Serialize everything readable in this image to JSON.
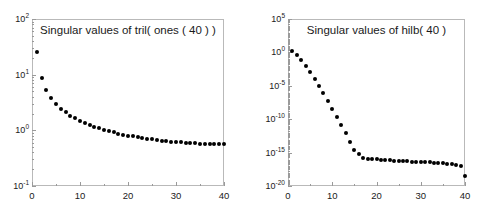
{
  "figure": {
    "background_color": "#ffffff",
    "axis_color": "#b9b9b9",
    "marker_color": "#000000",
    "panels": [
      {
        "id": "tril-ones-40",
        "title": "Singular values of tril( ones ( 40 ) )",
        "x_ticks": [
          "0",
          "10",
          "20",
          "30",
          "40"
        ],
        "y_ticks": [
          "10",
          "10",
          "10",
          "10"
        ],
        "y_tick_exponents": [
          "2",
          "1",
          "0",
          "-1"
        ]
      },
      {
        "id": "hilb-40",
        "title": "Singular values of hilb( 40 )",
        "x_ticks": [
          "0",
          "10",
          "20",
          "30",
          "40"
        ],
        "y_ticks": [
          "10",
          "10",
          "10",
          "10",
          "10",
          "10"
        ],
        "y_tick_exponents": [
          "5",
          "0",
          "-5",
          "-10",
          "-15",
          "-20"
        ]
      }
    ]
  },
  "chart_data": [
    {
      "type": "scatter",
      "id": "tril-ones-40",
      "title": "Singular values of tril( ones ( 40 ) )",
      "xlabel": "",
      "ylabel": "",
      "xlim": [
        0,
        40
      ],
      "ylim": [
        0.1,
        100
      ],
      "yscale": "log",
      "xscale": "linear",
      "grid": false,
      "legend": null,
      "marker": "filled-circle",
      "x": [
        1,
        2,
        3,
        4,
        5,
        6,
        7,
        8,
        9,
        10,
        11,
        12,
        13,
        14,
        15,
        16,
        17,
        18,
        19,
        20,
        21,
        22,
        23,
        24,
        25,
        26,
        27,
        28,
        29,
        30,
        31,
        32,
        33,
        34,
        35,
        36,
        37,
        38,
        39,
        40
      ],
      "y": [
        25.4,
        8.6,
        5.2,
        3.75,
        2.95,
        2.45,
        2.1,
        1.84,
        1.64,
        1.48,
        1.35,
        1.25,
        1.16,
        1.08,
        1.02,
        0.965,
        0.917,
        0.875,
        0.838,
        0.805,
        0.776,
        0.75,
        0.727,
        0.706,
        0.687,
        0.67,
        0.655,
        0.641,
        0.629,
        0.618,
        0.608,
        0.599,
        0.591,
        0.584,
        0.578,
        0.572,
        0.567,
        0.563,
        0.56,
        0.557
      ]
    },
    {
      "type": "scatter",
      "id": "hilb-40",
      "title": "Singular values of hilb( 40 )",
      "xlabel": "",
      "ylabel": "",
      "xlim": [
        0,
        40
      ],
      "ylim": [
        1e-20,
        100000.0
      ],
      "yscale": "log",
      "xscale": "linear",
      "grid": false,
      "legend": null,
      "marker": "filled-circle",
      "x": [
        1,
        2,
        3,
        4,
        5,
        6,
        7,
        8,
        9,
        10,
        11,
        12,
        13,
        14,
        15,
        16,
        17,
        18,
        19,
        20,
        21,
        22,
        23,
        24,
        25,
        26,
        27,
        28,
        29,
        30,
        31,
        32,
        33,
        34,
        35,
        36,
        37,
        38,
        39,
        40
      ],
      "y": [
        1.6,
        0.44,
        0.07,
        0.009,
        0.001,
        0.0001,
        9e-06,
        7.5e-07,
        5.5e-08,
        3.8e-09,
        2.4e-10,
        1.4e-11,
        7.5e-13,
        4e-14,
        2.8e-15,
        6.5e-16,
        1.6e-16,
        1.2e-16,
        1.1e-16,
        1e-16,
        8.5e-17,
        7.5e-17,
        6.8e-17,
        6.2e-17,
        5.6e-17,
        5.2e-17,
        4.8e-17,
        4.5e-17,
        4.2e-17,
        3.9e-17,
        3.6e-17,
        3.3e-17,
        3e-17,
        2.7e-17,
        2.4e-17,
        2.1e-17,
        1.8e-17,
        1.4e-17,
        9e-18,
        3e-19
      ]
    }
  ]
}
